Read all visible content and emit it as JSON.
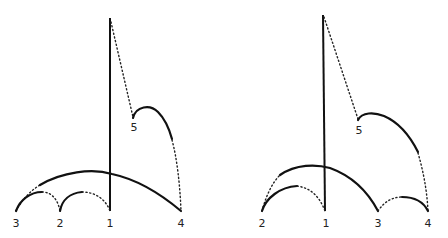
{
  "figure": {
    "colors": {
      "line": "#111111",
      "background": "#ffffff"
    },
    "left": {
      "labels": {
        "n3": "3",
        "n2": "2",
        "n1": "1",
        "n4": "4",
        "n5": "5"
      },
      "node_order_left_to_right": [
        "3",
        "2",
        "1",
        "4"
      ],
      "elevated_node": "5"
    },
    "right": {
      "labels": {
        "n2": "2",
        "n1": "1",
        "n3": "3",
        "n4": "4",
        "n5": "5"
      },
      "node_order_left_to_right": [
        "2",
        "1",
        "3",
        "4"
      ],
      "elevated_node": "5"
    }
  }
}
